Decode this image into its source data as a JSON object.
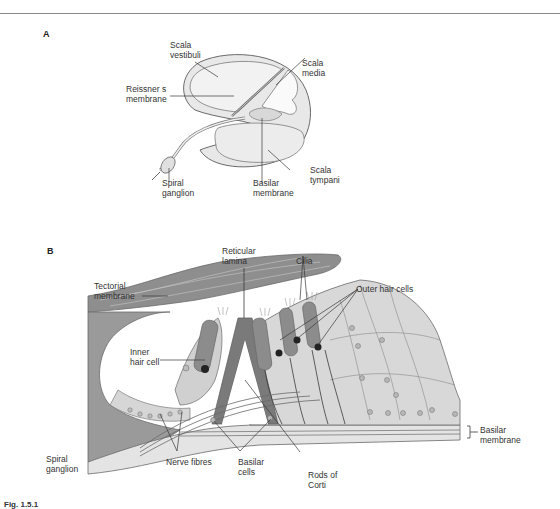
{
  "figure": {
    "caption_fragment": "Fig. 1.5.1",
    "panels": [
      {
        "letter": "A",
        "labels": {
          "scala_vestibuli": "Scala\nvestibuli",
          "scala_media": "Scala\nmedia",
          "reissners_membrane": "Reissner s\nmembrane",
          "scala_tympani": "Scala\ntympani",
          "spiral_ganglion": "Spiral\nganglion",
          "basilar_membrane": "Basilar\nmembrane"
        }
      },
      {
        "letter": "B",
        "labels": {
          "reticular_lamina": "Reticular\nlamina",
          "cilia": "Cilia",
          "tectorial_membrane": "Tectorial\nmembrane",
          "outer_hair_cells": "Outer hair cells",
          "inner_hair_cell": "Inner\nhair cell",
          "basilar_membrane": "Basilar\nmembrane",
          "spiral_ganglion": "Spiral\nganglion",
          "nerve_fibres": "Nerve fibres",
          "basilar_cells": "Basilar\ncells",
          "rods_of_corti": "Rods of\nCorti"
        }
      }
    ]
  },
  "colors": {
    "fill_light": "#e6e6e6",
    "fill_mid": "#c8c8c8",
    "fill_dark": "#8c8c8c",
    "outline": "#6a6a6a",
    "leader": "#3a3a3a"
  }
}
